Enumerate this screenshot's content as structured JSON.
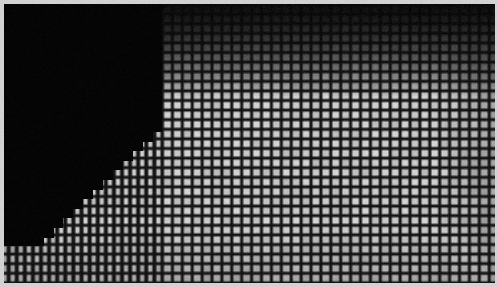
{
  "image": {
    "title": "grid-mesh-micrograph",
    "width": 498,
    "height": 287,
    "kind": "grayscale-micrograph",
    "description": "Grayscale micrograph of a rectangular micro-grid / mesh array with an opaque dark occlusion occupying the upper-left, bounded by a stepped diagonal edge."
  },
  "border": {
    "color": "#d2d2d2",
    "top_px": 4,
    "left_px": 4,
    "right_px": 3,
    "bottom_px": 4
  },
  "palette": {
    "background_light": "#b4b4b4",
    "cell_bright": "#c8c8c8",
    "cell_mid": "#a8a8a8",
    "grid_line_dark": "#141414",
    "occlusion_black": "#050505",
    "border_gray": "#d2d2d2",
    "vignette_dark": "#0a0a0a"
  },
  "grid": {
    "pitch_x_px": 9.9,
    "pitch_y_px": 9.6,
    "line_width_px": 3.1,
    "cells_across": 50,
    "cells_down": 29,
    "origin_x_px": 4,
    "origin_y_px": 4
  },
  "coarse_grid": {
    "note": "Left portion of the field shows a coarser/heavier vertical line set",
    "transition_x_px": 162,
    "left_pitch_x_px": 8.1,
    "left_line_width_px": 4.0,
    "right_pitch_x_px": 9.9,
    "right_line_width_px": 3.1
  },
  "occlusion": {
    "shape": "stepped-diagonal",
    "fill": "#050505",
    "top_edge_x_px": 162,
    "bottom_left_x_px": 16,
    "vertical_cut_y_px": 122,
    "diagonal_start": {
      "x": 162,
      "y": 122
    },
    "diagonal_end": {
      "x": 16,
      "y": 246
    },
    "step_width_px": 9.9,
    "step_height_px": 9.6
  },
  "row_dark_band": {
    "note": "Upper rows are strongly attenuated: horizontal line set nearly saturates to black toward the top",
    "top_y_px": 4,
    "fade_end_y_px": 96
  },
  "chart_data": {
    "type": "heatmap",
    "title": "",
    "xlabel": "",
    "ylabel": "",
    "grid": true,
    "legend": "none",
    "xlim": [
      0,
      498
    ],
    "ylim": [
      0,
      287
    ],
    "colormap": "grayscale",
    "value_range": [
      0,
      255
    ],
    "regions": [
      {
        "name": "occlusion-upper-left",
        "mean_value": 6,
        "x": [
          4,
          162
        ],
        "y": [
          4,
          246
        ]
      },
      {
        "name": "mesh-bright-lower-right",
        "mean_value": 186,
        "x": [
          162,
          494
        ],
        "y": [
          110,
          283
        ]
      },
      {
        "name": "mesh-attenuated-top",
        "mean_value": 92,
        "x": [
          162,
          494
        ],
        "y": [
          4,
          96
        ]
      },
      {
        "name": "mesh-left-coarse",
        "mean_value": 150,
        "x": [
          4,
          162
        ],
        "y": [
          200,
          283
        ]
      }
    ]
  }
}
